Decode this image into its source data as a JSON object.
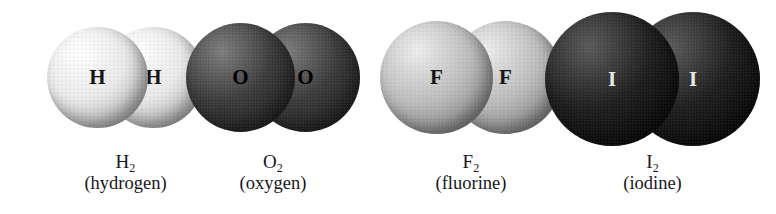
{
  "figure": {
    "background": "#ffffff",
    "width": 776,
    "height": 214
  },
  "molecules": [
    {
      "id": "hydrogen",
      "symbol": "H",
      "formula_element": "H",
      "formula_subscript": "2",
      "common_name": "(hydrogen)",
      "atom_count": 2,
      "sphere_color": "#e9e9e9",
      "sphere_highlight": "#ffffff",
      "sphere_shadow": "#9a9a9a",
      "label_color": "#141414",
      "symbol_font_size": 21,
      "diameter": 101,
      "left": 47,
      "top": 27,
      "overlap": 45,
      "caption_top": 152
    },
    {
      "id": "oxygen",
      "symbol": "O",
      "formula_element": "O",
      "formula_subscript": "2",
      "common_name": "(oxygen)",
      "atom_count": 2,
      "sphere_color": "#3b3b3b",
      "sphere_highlight": "#7d7d7d",
      "sphere_shadow": "#141414",
      "label_color": "#000000",
      "symbol_font_size": 21,
      "diameter": 109,
      "left": 186,
      "top": 23,
      "overlap": 44,
      "caption_top": 152
    },
    {
      "id": "fluorine",
      "symbol": "F",
      "formula_element": "F",
      "formula_subscript": "2",
      "common_name": "(fluorine)",
      "atom_count": 2,
      "sphere_color": "#bdbdbd",
      "sphere_highlight": "#ededed",
      "sphere_shadow": "#6f6f6f",
      "label_color": "#161616",
      "symbol_font_size": 21,
      "diameter": 113,
      "left": 380,
      "top": 21,
      "overlap": 44,
      "caption_top": 152
    },
    {
      "id": "iodine",
      "symbol": "I",
      "formula_element": "I",
      "formula_subscript": "2",
      "common_name": "(iodine)",
      "atom_count": 2,
      "sphere_color": "#1e1e1e",
      "sphere_highlight": "#5a5a5a",
      "sphere_shadow": "#000000",
      "label_color": "#e8e8e8",
      "symbol_font_size": 21,
      "diameter": 134,
      "left": 545,
      "top": 12,
      "overlap": 53,
      "caption_top": 152
    }
  ]
}
